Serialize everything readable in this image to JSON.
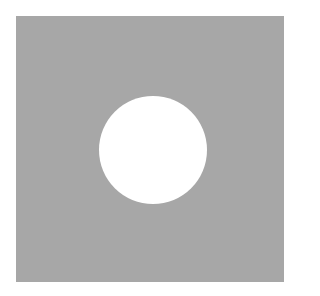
{
  "figure": {
    "background_color": "#ffffff",
    "square": {
      "color": "#a7a7a7",
      "shape": "square"
    },
    "hole": {
      "color": "#ffffff",
      "shape": "circle"
    }
  }
}
